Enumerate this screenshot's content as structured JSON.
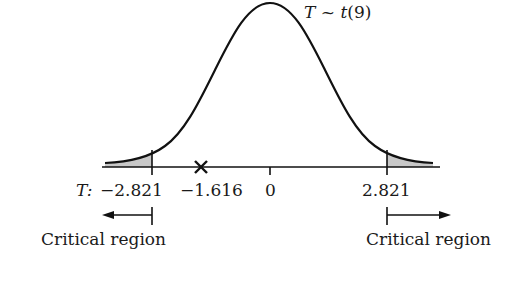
{
  "diagram": {
    "distribution_label": {
      "var": "T",
      "tilde": "~",
      "dist": "t",
      "df": "(9)"
    },
    "axis": {
      "variable": "T:",
      "ticks": [
        {
          "value": -2.821,
          "label": "−2.821"
        },
        {
          "value": 0,
          "label": "0"
        },
        {
          "value": 2.821,
          "label": "2.821"
        }
      ]
    },
    "test_statistic": {
      "value": -1.616,
      "label": "−1.616",
      "marker": "cross-marker"
    },
    "critical_regions": [
      {
        "side": "left",
        "label": "Critical region",
        "boundary": -2.821
      },
      {
        "side": "right",
        "label": "Critical region",
        "boundary": 2.821
      }
    ],
    "colors": {
      "curve": "#111111",
      "shade": "#c8c8c8",
      "text": "#1a1a1a"
    }
  }
}
